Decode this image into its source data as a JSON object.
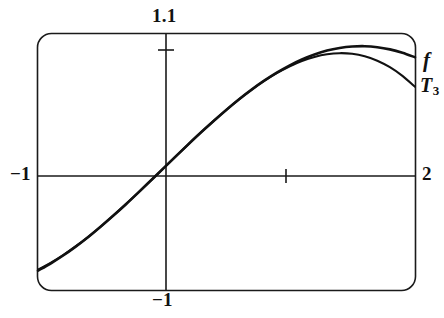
{
  "chart_data": {
    "type": "line",
    "title": "",
    "subtitle": "",
    "xlabel": "",
    "ylabel": "",
    "xlim": [
      -1,
      2
    ],
    "ylim": [
      -1,
      1.1
    ],
    "grid": false,
    "legend_position": "right-edge-inline",
    "frame": "rounded-rectangle-viewport",
    "axis_ticks": {
      "x_ticks": [
        1
      ],
      "y_ticks": [
        1
      ]
    },
    "tick_labels": {
      "left": "−1",
      "right": "2",
      "top": "1.1",
      "bottom": "−1"
    },
    "annotations": [
      {
        "text": "f",
        "x": 2,
        "y": 0.62,
        "style": "italic"
      },
      {
        "text": "T3",
        "x": 2,
        "y": 0.42,
        "style": "italic-subscript"
      }
    ],
    "series": [
      {
        "name": "f",
        "label": "f",
        "color": "#111111",
        "x": [
          -1.0,
          -0.9,
          -0.8,
          -0.7,
          -0.6,
          -0.5,
          -0.4,
          -0.3,
          -0.2,
          -0.1,
          0.0,
          0.1,
          0.2,
          0.3,
          0.4,
          0.5,
          0.6,
          0.7,
          0.8,
          0.9,
          1.0,
          1.1,
          1.2,
          1.3,
          1.4,
          1.5,
          1.6,
          1.7,
          1.8,
          1.9,
          2.0
        ],
        "y": [
          -0.841,
          -0.783,
          -0.717,
          -0.644,
          -0.565,
          -0.479,
          -0.389,
          -0.296,
          -0.199,
          -0.0998,
          0.0,
          0.0998,
          0.199,
          0.296,
          0.389,
          0.479,
          0.565,
          0.644,
          0.717,
          0.783,
          0.841,
          0.891,
          0.932,
          0.964,
          0.985,
          0.997,
          1.0,
          0.992,
          0.974,
          0.946,
          0.909
        ]
      },
      {
        "name": "T3",
        "label": "T₃",
        "color": "#111111",
        "x": [
          -1.0,
          -0.9,
          -0.8,
          -0.7,
          -0.6,
          -0.5,
          -0.4,
          -0.3,
          -0.2,
          -0.1,
          0.0,
          0.1,
          0.2,
          0.3,
          0.4,
          0.5,
          0.6,
          0.7,
          0.8,
          0.9,
          1.0,
          1.1,
          1.2,
          1.3,
          1.4,
          1.5,
          1.6,
          1.7,
          1.8,
          1.9,
          2.0
        ],
        "y": [
          -0.8333,
          -0.7785,
          -0.7147,
          -0.6428,
          -0.564,
          -0.4792,
          -0.3893,
          -0.2955,
          -0.1987,
          -0.0998,
          0.0,
          0.0998,
          0.1987,
          0.2955,
          0.3893,
          0.4792,
          0.564,
          0.6428,
          0.7147,
          0.7785,
          0.8333,
          0.8782,
          0.912,
          0.9338,
          0.9427,
          0.9375,
          0.9173,
          0.8812,
          0.828,
          0.7568,
          0.6667
        ]
      }
    ]
  }
}
